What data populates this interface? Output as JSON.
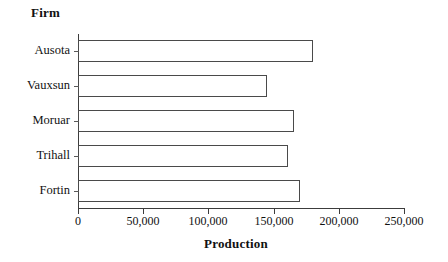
{
  "chart_data": {
    "type": "bar",
    "orientation": "horizontal",
    "title": "",
    "xlabel": "Production",
    "ylabel": "Firm",
    "categories": [
      "Ausota",
      "Vauxsun",
      "Moruar",
      "Trihall",
      "Fortin"
    ],
    "values": [
      180000,
      145000,
      166000,
      161000,
      170000
    ],
    "xlim": [
      0,
      250000
    ],
    "xticks": [
      0,
      50000,
      100000,
      150000,
      200000,
      250000
    ],
    "xtick_labels": [
      "0",
      "50,000",
      "100,000",
      "150,000",
      "200,000",
      "250,000"
    ],
    "grid": false,
    "legend": false,
    "bar_fill_color": "#ffffff",
    "bar_border_color": "#4a4a4a",
    "axis_color": "#3c3c3c",
    "background_color": "#ffffff"
  },
  "labels": {
    "y_axis_title": "Firm",
    "x_axis_title": "Production"
  }
}
